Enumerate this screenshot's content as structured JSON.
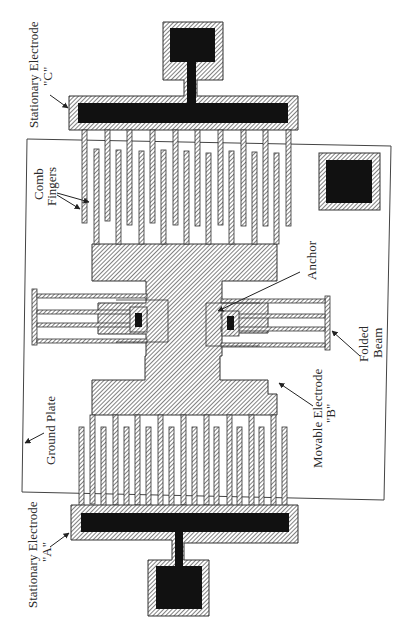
{
  "figure": {
    "type": "MEMS comb-drive actuator layout (rotated 90°)",
    "colors": {
      "background": "#ffffff",
      "fill_solid": "#111111",
      "hatch_line": "#555555",
      "outline": "#333333"
    }
  },
  "labels": {
    "stationary_c_line1": "Stationary Electrode",
    "stationary_c_line2": "\"C\"",
    "comb_line1": "Comb",
    "comb_line2": "Fingers",
    "anchor": "Anchor",
    "folded_line1": "Folded",
    "folded_line2": "Beam",
    "movable_line1": "Movable Electrode",
    "movable_line2": "\"B\"",
    "ground_plate": "Ground Plate",
    "stationary_a_line1": "Stationary Electrode",
    "stationary_a_line2": "\"A\""
  },
  "components": [
    {
      "name": "Stationary Electrode C",
      "role": "fixed comb electrode (top)"
    },
    {
      "name": "Stationary Electrode A",
      "role": "fixed comb electrode (bottom)"
    },
    {
      "name": "Movable Electrode B",
      "role": "shuttle with interdigitated fingers"
    },
    {
      "name": "Comb Fingers",
      "role": "interdigitated capacitive fingers"
    },
    {
      "name": "Folded Beam",
      "role": "suspension spring"
    },
    {
      "name": "Anchor",
      "role": "fixed point of folded beam"
    },
    {
      "name": "Ground Plate",
      "role": "underlying ground plane"
    }
  ]
}
